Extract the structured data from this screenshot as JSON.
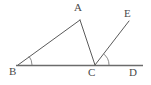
{
  "figure": {
    "kind": "geometry-diagram",
    "width": 151,
    "height": 85,
    "background_color": "#ffffff",
    "line_color": "#5a5a5a",
    "baseline_color": "#6b6b6b",
    "arc_color": "#7d7d7d",
    "label_color": "#4a4a4a"
  },
  "points": {
    "A": {
      "label": "A",
      "x": 80,
      "y": 20,
      "label_x": 74,
      "label_y": 2
    },
    "B": {
      "label": "B",
      "x": 18,
      "y": 65,
      "label_x": 9,
      "label_y": 66
    },
    "C": {
      "label": "C",
      "x": 95,
      "y": 65,
      "label_x": 88,
      "label_y": 67
    },
    "D": {
      "label": "D",
      "x": 141,
      "y": 65,
      "label_x": 129,
      "label_y": 67
    },
    "E": {
      "label": "E",
      "x": 128,
      "y": 22,
      "label_x": 124,
      "label_y": 8
    }
  },
  "segments": [
    {
      "name": "segment-BA",
      "from": "B",
      "to": "A"
    },
    {
      "name": "segment-AC",
      "from": "A",
      "to": "C"
    },
    {
      "name": "segment-CE",
      "from": "C",
      "to": "E"
    },
    {
      "name": "line-BD",
      "from": "B",
      "to": "D"
    }
  ],
  "angle_marks": [
    {
      "name": "angle-arc-B",
      "vertex": "B",
      "radius": 14
    },
    {
      "name": "angle-arc-C",
      "vertex": "C",
      "radius": 14
    }
  ],
  "labels": {
    "A": "A",
    "B": "B",
    "C": "C",
    "D": "D",
    "E": "E"
  }
}
